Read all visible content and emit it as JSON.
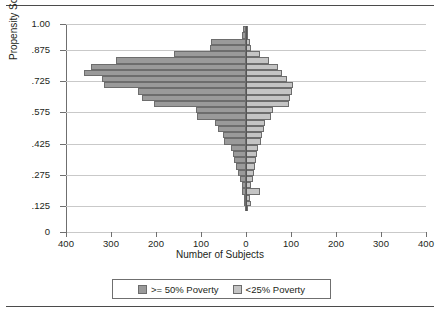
{
  "chart_data": {
    "type": "bar",
    "orientation": "horizontal-pyramid",
    "title": "",
    "xlabel": "Number of Subjects",
    "ylabel": "Propensity Score",
    "xlim": [
      -400,
      400
    ],
    "ylim": [
      0,
      1.0
    ],
    "grid": true,
    "legend_position": "bottom",
    "x_ticks": [
      {
        "label": "400",
        "value": -400
      },
      {
        "label": "300",
        "value": -300
      },
      {
        "label": "200",
        "value": -200
      },
      {
        "label": "100",
        "value": -100
      },
      {
        "label": "0",
        "value": 0
      },
      {
        "label": "100",
        "value": 100
      },
      {
        "label": "200",
        "value": 200
      },
      {
        "label": "300",
        "value": 300
      },
      {
        "label": "400",
        "value": 400
      }
    ],
    "y_ticks": [
      {
        "label": "1.00",
        "value": 1.0
      },
      {
        "label": ".875",
        "value": 0.875
      },
      {
        "label": ".725",
        "value": 0.725
      },
      {
        "label": ".575",
        "value": 0.575
      },
      {
        "label": ".425",
        "value": 0.425
      },
      {
        "label": ".275",
        "value": 0.275
      },
      {
        "label": ".125",
        "value": 0.125
      },
      {
        "label": "0",
        "value": 0
      }
    ],
    "series": [
      {
        "name": ">= 50% Poverty",
        "side": "left",
        "color": "#9a9a9a"
      },
      {
        "name": "<25% Poverty",
        "side": "right",
        "color": "#c4c4c4"
      }
    ],
    "bins": [
      {
        "y_low": 0.96,
        "y_high": 0.99,
        "left": 6,
        "right": 2
      },
      {
        "y_low": 0.93,
        "y_high": 0.96,
        "left": 10,
        "right": 3
      },
      {
        "y_low": 0.9,
        "y_high": 0.93,
        "left": 78,
        "right": 8
      },
      {
        "y_low": 0.87,
        "y_high": 0.9,
        "left": 80,
        "right": 10
      },
      {
        "y_low": 0.84,
        "y_high": 0.87,
        "left": 160,
        "right": 32
      },
      {
        "y_low": 0.81,
        "y_high": 0.84,
        "left": 290,
        "right": 52
      },
      {
        "y_low": 0.78,
        "y_high": 0.81,
        "left": 345,
        "right": 70
      },
      {
        "y_low": 0.75,
        "y_high": 0.78,
        "left": 360,
        "right": 80
      },
      {
        "y_low": 0.72,
        "y_high": 0.75,
        "left": 320,
        "right": 90
      },
      {
        "y_low": 0.69,
        "y_high": 0.72,
        "left": 315,
        "right": 105
      },
      {
        "y_low": 0.66,
        "y_high": 0.69,
        "left": 240,
        "right": 102
      },
      {
        "y_low": 0.63,
        "y_high": 0.66,
        "left": 232,
        "right": 98
      },
      {
        "y_low": 0.6,
        "y_high": 0.63,
        "left": 205,
        "right": 95
      },
      {
        "y_low": 0.57,
        "y_high": 0.6,
        "left": 112,
        "right": 60
      },
      {
        "y_low": 0.54,
        "y_high": 0.57,
        "left": 110,
        "right": 55
      },
      {
        "y_low": 0.51,
        "y_high": 0.54,
        "left": 68,
        "right": 42
      },
      {
        "y_low": 0.48,
        "y_high": 0.51,
        "left": 62,
        "right": 40
      },
      {
        "y_low": 0.45,
        "y_high": 0.48,
        "left": 52,
        "right": 36
      },
      {
        "y_low": 0.42,
        "y_high": 0.45,
        "left": 48,
        "right": 34
      },
      {
        "y_low": 0.39,
        "y_high": 0.42,
        "left": 34,
        "right": 26
      },
      {
        "y_low": 0.36,
        "y_high": 0.39,
        "left": 30,
        "right": 24
      },
      {
        "y_low": 0.33,
        "y_high": 0.36,
        "left": 26,
        "right": 22
      },
      {
        "y_low": 0.3,
        "y_high": 0.33,
        "left": 22,
        "right": 20
      },
      {
        "y_low": 0.27,
        "y_high": 0.3,
        "left": 18,
        "right": 18
      },
      {
        "y_low": 0.24,
        "y_high": 0.27,
        "left": 14,
        "right": 15
      },
      {
        "y_low": 0.21,
        "y_high": 0.24,
        "left": 10,
        "right": 12
      },
      {
        "y_low": 0.18,
        "y_high": 0.21,
        "left": 8,
        "right": 30
      },
      {
        "y_low": 0.15,
        "y_high": 0.18,
        "left": 5,
        "right": 8
      },
      {
        "y_low": 0.125,
        "y_high": 0.15,
        "left": 4,
        "right": 12
      },
      {
        "y_low": 0.1,
        "y_high": 0.125,
        "left": 2,
        "right": 3
      }
    ]
  },
  "axes": {
    "y_title": "Propensity Score",
    "x_title": "Number of Subjects"
  },
  "legend": {
    "items": [
      {
        "label": ">= 50% Poverty",
        "color": "#9a9a9a"
      },
      {
        "label": "<25% Poverty",
        "color": "#c4c4c4"
      }
    ]
  }
}
